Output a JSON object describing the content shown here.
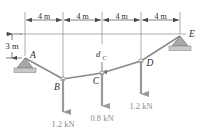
{
  "figure": {
    "colors": {
      "member": "#8a8a8a",
      "load_arrow": "#9a9a9a",
      "dimension": "#4a4a4a",
      "support_fill": "#b0b0b0",
      "label": "#2b2b2b",
      "load_label": "#8c8c8c",
      "background": "#ffffff"
    },
    "top_dimensions": {
      "segments": [
        {
          "label": "4 m"
        },
        {
          "label": "4 m"
        },
        {
          "label": "4 m"
        },
        {
          "label": "4 m"
        }
      ]
    },
    "vertical_dimension": {
      "label": "3 m"
    },
    "sag_dimension": {
      "label": "d",
      "subscript": "C"
    },
    "nodes": [
      {
        "name": "A",
        "label": "A",
        "x": 25,
        "y": 58,
        "support": "pin",
        "marker": "none"
      },
      {
        "name": "B",
        "label": "B",
        "x": 63,
        "y": 79,
        "support": "none",
        "marker": "circle"
      },
      {
        "name": "C",
        "label": "C",
        "x": 102,
        "y": 73,
        "support": "none",
        "marker": "circle"
      },
      {
        "name": "D",
        "label": "D",
        "x": 141,
        "y": 61,
        "support": "none",
        "marker": "circle"
      },
      {
        "name": "E",
        "label": "E",
        "x": 180,
        "y": 36,
        "support": "roller",
        "marker": "none"
      }
    ],
    "loads": [
      {
        "at": "B",
        "label": "1.2 kN",
        "x": 63,
        "y_start": 79,
        "y_end": 112,
        "text_x": 63,
        "text_y": 128
      },
      {
        "at": "C",
        "label": "0.8 kN",
        "x": 102,
        "y_start": 73,
        "y_end": 106,
        "text_x": 102,
        "text_y": 122
      },
      {
        "at": "D",
        "label": "1.2 kN",
        "x": 141,
        "y_start": 61,
        "y_end": 94,
        "text_x": 141,
        "text_y": 110
      }
    ]
  }
}
